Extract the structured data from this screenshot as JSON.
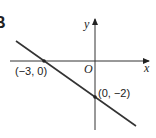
{
  "figure": {
    "part_label": "B",
    "axis_x_label": "x",
    "axis_y_label": "y",
    "origin_label": "O",
    "points": [
      {
        "label": "(−3, 0)",
        "x": -3,
        "y": 0
      },
      {
        "label": "(0, −2)",
        "x": 0,
        "y": -2
      }
    ],
    "line": "passes through (-3, 0) and (0, -2)"
  }
}
